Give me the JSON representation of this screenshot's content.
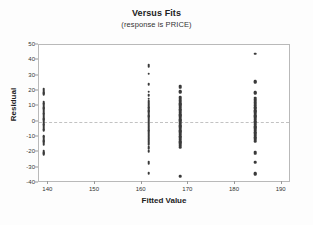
{
  "chart_data": {
    "type": "scatter",
    "title": "Versus Fits",
    "subtitle": "(response is PRICE)",
    "xlabel": "Fitted Value",
    "ylabel": "Residual",
    "xlim": [
      138,
      192
    ],
    "ylim": [
      -40,
      50
    ],
    "xticks": [
      140,
      150,
      160,
      170,
      180,
      190
    ],
    "yticks": [
      50,
      40,
      30,
      20,
      10,
      0,
      -10,
      -20,
      -30,
      -40
    ],
    "grid": false,
    "legend": "none",
    "reference_line": {
      "y": 0,
      "style": "dashed",
      "color": "#c2c2c2"
    },
    "marker_color": "#3a3a3a",
    "frame_color": "#b9b9b9",
    "groups": [
      {
        "name": "cluster-139",
        "x": 139.0,
        "y": [
          21.0,
          20.2,
          19.4,
          18.6,
          17.8,
          13.0,
          12.2,
          11.4,
          10.5,
          9.6,
          8.8,
          8.0,
          7.2,
          6.4,
          5.6,
          4.8,
          4.0,
          3.2,
          2.4,
          1.6,
          0.8,
          0.0,
          -0.8,
          -1.6,
          -2.4,
          -3.2,
          -4.0,
          -4.8,
          -5.6,
          -9.5,
          -10.3,
          -11.1,
          -11.9,
          -12.7,
          -13.5,
          -14.3,
          -15.1,
          -19.0,
          -19.8,
          -20.6,
          -21.4
        ]
      },
      {
        "name": "cluster-161",
        "x": 161.5,
        "y": [
          36.8,
          35.8,
          31.2,
          24.3,
          19.6,
          17.2,
          15.0,
          13.6,
          12.6,
          11.6,
          10.6,
          9.6,
          8.6,
          7.6,
          6.8,
          6.0,
          5.2,
          4.4,
          3.6,
          2.8,
          2.0,
          1.2,
          0.4,
          -0.6,
          -1.6,
          -2.6,
          -3.6,
          -4.6,
          -5.4,
          -6.4,
          -7.4,
          -8.4,
          -9.4,
          -10.4,
          -11.4,
          -12.6,
          -13.6,
          -14.6,
          -16.2,
          -17.4,
          -19.2,
          -26.6,
          -27.4,
          -33.6
        ]
      },
      {
        "name": "cluster-168",
        "x": 168.2,
        "y": [
          23.0,
          22.2,
          20.0,
          19.2,
          16.0,
          15.0,
          14.0,
          13.0,
          12.2,
          11.4,
          10.6,
          9.8,
          9.0,
          8.2,
          7.4,
          6.6,
          5.8,
          5.0,
          4.2,
          3.4,
          2.6,
          1.8,
          1.0,
          0.2,
          -0.6,
          -1.4,
          -2.2,
          -3.0,
          -3.8,
          -4.6,
          -5.4,
          -6.2,
          -7.0,
          -7.8,
          -8.6,
          -9.4,
          -10.2,
          -11.0,
          -11.8,
          -12.6,
          -13.4,
          -14.2,
          -15.0,
          -15.8,
          -16.6,
          -35.4
        ]
      },
      {
        "name": "cluster-184",
        "x": 184.3,
        "y": [
          44.2,
          26.4,
          25.6,
          19.2,
          18.4,
          15.6,
          14.6,
          13.6,
          12.6,
          11.6,
          10.6,
          9.6,
          8.6,
          7.6,
          6.8,
          6.0,
          5.2,
          4.4,
          3.6,
          2.8,
          2.0,
          1.2,
          0.4,
          -0.4,
          -1.2,
          -2.0,
          -2.8,
          -3.6,
          -4.4,
          -5.2,
          -6.0,
          -6.8,
          -7.6,
          -8.4,
          -9.2,
          -10.0,
          -10.8,
          -11.8,
          -12.6,
          -20.0,
          -20.8,
          -26.4,
          -33.6,
          -34.4
        ]
      }
    ]
  }
}
